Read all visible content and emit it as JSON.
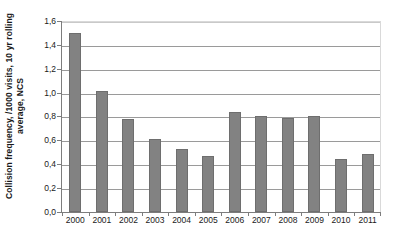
{
  "chart_data": {
    "type": "bar",
    "title": "",
    "subtitle": "",
    "xlabel": "",
    "ylabel": "Collision frequency, /1000 visits, 10 yr rolling average, NCS",
    "categories": [
      "2000",
      "2001",
      "2002",
      "2003",
      "2004",
      "2005",
      "2006",
      "2007",
      "2008",
      "2009",
      "2010",
      "2011"
    ],
    "values": [
      1.5,
      1.01,
      0.78,
      0.61,
      0.53,
      0.47,
      0.84,
      0.8,
      0.79,
      0.8,
      0.44,
      0.49
    ],
    "ylim": [
      0.0,
      1.6
    ],
    "ytick_labels": [
      "1,6",
      "1,4",
      "1,2",
      "1,0",
      "0,8",
      "0,6",
      "0,4",
      "0,2",
      "0,0"
    ],
    "ytick_values": [
      1.6,
      1.4,
      1.2,
      1.0,
      0.8,
      0.6,
      0.4,
      0.2,
      0.0
    ],
    "grid": true,
    "legend": null,
    "legend_position": "none",
    "series": [
      {
        "name": "Collision frequency",
        "values": [
          1.5,
          1.01,
          0.78,
          0.61,
          0.53,
          0.47,
          0.84,
          0.8,
          0.79,
          0.8,
          0.44,
          0.49
        ]
      }
    ],
    "colors": {
      "bar_fill": "#828282",
      "bar_border": "#6e6e6e",
      "gridline": "#9a9a9a",
      "axis": "#7d7d7d",
      "text": "#1a1a1a",
      "background": "#ffffff"
    }
  }
}
